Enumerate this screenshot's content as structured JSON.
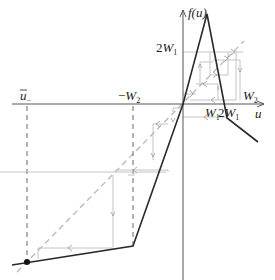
{
  "diagram": {
    "type": "piecewise-linear map with cobweb iteration",
    "axes": {
      "x_label": "u",
      "y_label": "f(u)"
    },
    "labels": {
      "y_tick_2W1": {
        "main": "2W",
        "sub": "1"
      },
      "x_tick_W1": {
        "main": "W",
        "sub": "1"
      },
      "x_tick_2W1": {
        "main": "2W",
        "sub": "1"
      },
      "x_tick_W2": {
        "main": "W",
        "sub": "2"
      },
      "x_tick_negW2": {
        "main": "−W",
        "sub": "2"
      },
      "x_tick_ubar_minus": {
        "main": "ū",
        "sub": "−"
      }
    },
    "colors": {
      "curve": "#2a2a2a",
      "axis": "#555555",
      "diagonal": "#b8b8b8",
      "cobweb": "#bdbdbd",
      "dashed_guides": "#555555",
      "fixed_point": "#111111"
    }
  }
}
